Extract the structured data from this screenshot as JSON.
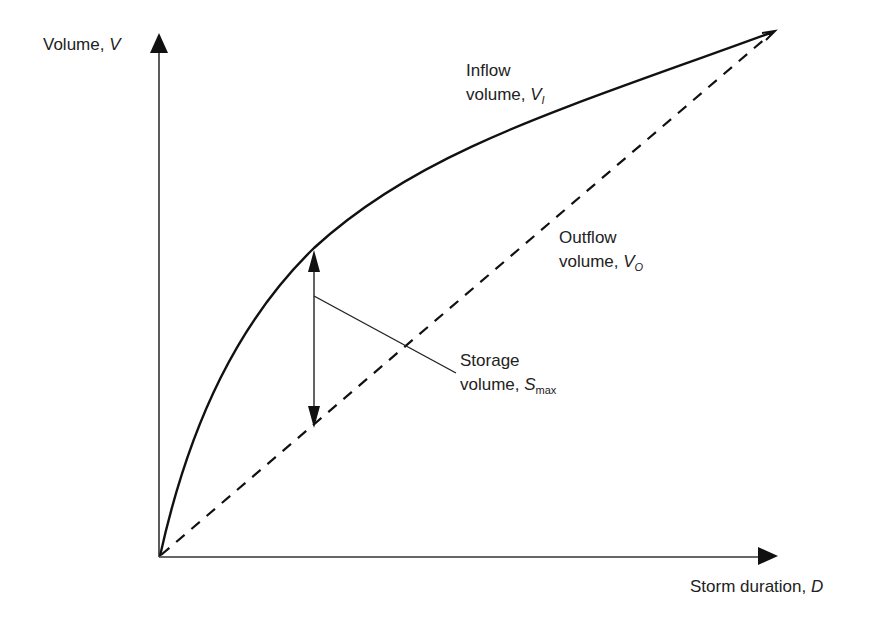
{
  "diagram": {
    "type": "volume-vs-duration storage diagram",
    "axes": {
      "y": {
        "label": "Volume, ",
        "symbol": "V"
      },
      "x": {
        "label": "Storm duration, ",
        "symbol": "D"
      }
    },
    "curves": {
      "inflow": {
        "line1": "Inflow",
        "line2": "volume, ",
        "symbol": "V",
        "subscript": "I",
        "style": "solid curve"
      },
      "outflow": {
        "line1": "Outflow",
        "line2": "volume, ",
        "symbol": "V",
        "subscript": "O",
        "style": "dashed straight line"
      }
    },
    "storage": {
      "line1": "Storage",
      "line2": "volume, ",
      "symbol": "S",
      "subscript": "max",
      "style": "double-headed vertical arrow with leader line"
    },
    "colors": {
      "line": "#111111",
      "background": "#ffffff",
      "text": "#222222"
    }
  }
}
